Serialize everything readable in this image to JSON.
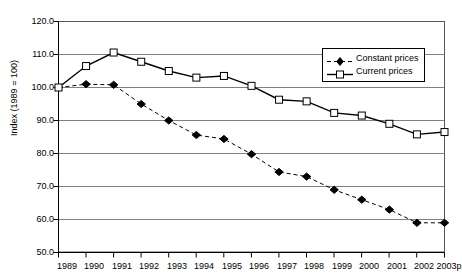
{
  "chart_data": {
    "type": "line",
    "title": "",
    "subtitle": "",
    "xlabel": "",
    "ylabel": "Index (1989 = 100)",
    "ylim": [
      50.0,
      120.0
    ],
    "ytick_labels": [
      "50.0",
      "60.0",
      "70.0",
      "80.0",
      "90.0",
      "100.0",
      "110.0",
      "120.0"
    ],
    "ytick_values": [
      50.0,
      60.0,
      70.0,
      80.0,
      90.0,
      100.0,
      110.0,
      120.0
    ],
    "grid": "horizontal",
    "legend_position": "top-right-inside",
    "categories": [
      "1989",
      "1990",
      "1991",
      "1992",
      "1993",
      "1994",
      "1995",
      "1996",
      "1997",
      "1998",
      "1999",
      "2000",
      "2001",
      "2002",
      "2003p"
    ],
    "x": [
      "1989",
      "1990",
      "1991",
      "1992",
      "1993",
      "1994",
      "1995",
      "1996",
      "1997",
      "1998",
      "1999",
      "2000",
      "2001",
      "2002",
      "2003p"
    ],
    "series": [
      {
        "name": "Constant prices",
        "marker": "filled-diamond",
        "line_style": "dashed",
        "color": "#000000",
        "values": [
          100.0,
          101.0,
          100.8,
          95.0,
          90.0,
          85.6,
          84.4,
          79.8,
          74.4,
          73.0,
          69.0,
          66.0,
          63.0,
          59.0,
          59.0
        ]
      },
      {
        "name": "Current prices",
        "marker": "open-square",
        "line_style": "solid",
        "color": "#000000",
        "values": [
          100.0,
          106.5,
          110.6,
          107.8,
          105.0,
          103.0,
          103.5,
          100.5,
          96.3,
          95.8,
          92.3,
          91.5,
          89.0,
          85.8,
          86.5
        ]
      }
    ]
  },
  "legend": {
    "items": [
      {
        "label": "Constant prices"
      },
      {
        "label": "Current prices"
      }
    ]
  },
  "axes": {
    "y_title": "Index (1989 = 100)"
  }
}
